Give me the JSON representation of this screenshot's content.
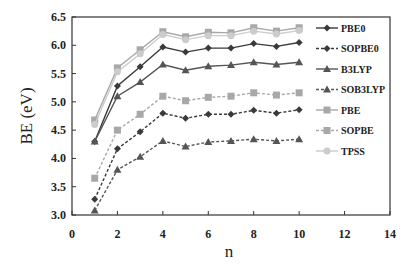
{
  "chart_data": {
    "type": "line",
    "title": "",
    "xlabel": "n",
    "ylabel": "BE (eV)",
    "xlim": [
      0,
      14
    ],
    "ylim": [
      3.0,
      6.5
    ],
    "xticks": [
      0,
      2,
      4,
      6,
      8,
      10,
      12,
      14
    ],
    "yticks": [
      "3.0",
      "3.5",
      "4.0",
      "4.5",
      "5.0",
      "5.5",
      "6.0",
      "6.5"
    ],
    "grid": false,
    "legend_position": "inside-right",
    "x": [
      1,
      2,
      3,
      4,
      5,
      6,
      7,
      8,
      9,
      10
    ],
    "series": [
      {
        "name": "PBE0",
        "marker": "diamond",
        "dash": "solid",
        "color": "#3a3a3a",
        "values": [
          4.3,
          5.28,
          5.62,
          5.97,
          5.88,
          5.95,
          5.95,
          6.03,
          5.98,
          6.05
        ]
      },
      {
        "name": "SOPBE0",
        "marker": "diamond",
        "dash": "dashed",
        "color": "#3a3a3a",
        "values": [
          3.28,
          4.17,
          4.47,
          4.8,
          4.71,
          4.78,
          4.78,
          4.85,
          4.8,
          4.86
        ]
      },
      {
        "name": "B3LYP",
        "marker": "triangle",
        "dash": "solid",
        "color": "#555555",
        "values": [
          4.3,
          5.1,
          5.35,
          5.66,
          5.56,
          5.63,
          5.65,
          5.7,
          5.66,
          5.7
        ]
      },
      {
        "name": "SOB3LYP",
        "marker": "triangle",
        "dash": "dashed",
        "color": "#555555",
        "values": [
          3.08,
          3.8,
          4.03,
          4.31,
          4.21,
          4.29,
          4.31,
          4.34,
          4.31,
          4.34
        ]
      },
      {
        "name": "PBE",
        "marker": "square",
        "dash": "solid",
        "color": "#a8a8a8",
        "values": [
          4.68,
          5.6,
          5.92,
          6.24,
          6.15,
          6.23,
          6.22,
          6.31,
          6.25,
          6.31
        ]
      },
      {
        "name": "SOPBE",
        "marker": "square",
        "dash": "dashed",
        "color": "#a8a8a8",
        "values": [
          3.65,
          4.5,
          4.78,
          5.1,
          5.02,
          5.08,
          5.1,
          5.16,
          5.12,
          5.16
        ]
      },
      {
        "name": "TPSS",
        "marker": "circle",
        "dash": "solid",
        "color": "#cccccc",
        "values": [
          4.6,
          5.53,
          5.85,
          6.19,
          6.1,
          6.17,
          6.17,
          6.25,
          6.2,
          6.26
        ]
      }
    ]
  }
}
